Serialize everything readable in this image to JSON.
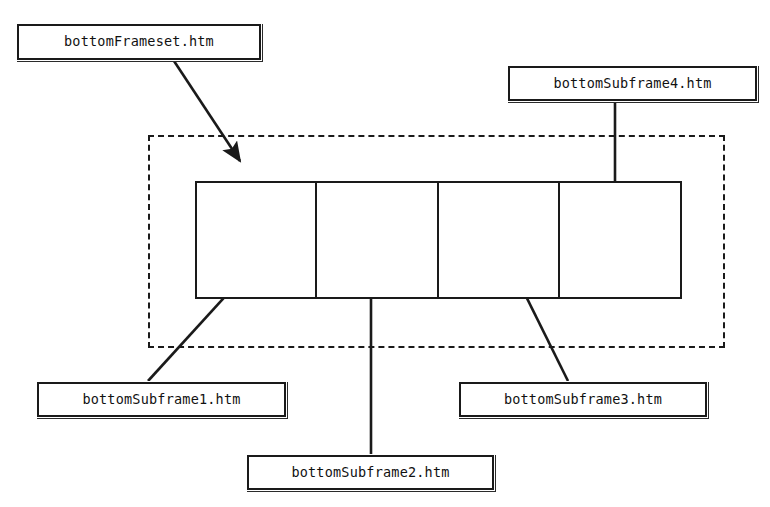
{
  "diagram": {
    "type": "html-frameset-structure-diagram",
    "background_color": "#ffffff",
    "stroke_color": "#1a1a1a",
    "labels": {
      "frameset": "bottomFrameset.htm",
      "subframe1": "bottomSubframe1.htm",
      "subframe2": "bottomSubframe2.htm",
      "subframe3": "bottomSubframe3.htm",
      "subframe4": "bottomSubframe4.htm"
    },
    "frameset_container": {
      "style": "dashed",
      "x": 148,
      "y": 135,
      "width": 577,
      "height": 213
    },
    "frame_row": {
      "x": 195,
      "y": 181,
      "width": 487,
      "height": 118,
      "cell_count": 4,
      "dividers_x": [
        315,
        437,
        558
      ]
    },
    "cells": [
      {
        "name": "frame-cell-1",
        "x": 195,
        "y": 181,
        "width": 120,
        "height": 118
      },
      {
        "name": "frame-cell-2",
        "x": 315,
        "y": 181,
        "width": 122,
        "height": 118
      },
      {
        "name": "frame-cell-3",
        "x": 437,
        "y": 181,
        "width": 121,
        "height": 118
      },
      {
        "name": "frame-cell-4",
        "x": 558,
        "y": 181,
        "width": 124,
        "height": 118
      }
    ],
    "label_boxes": [
      {
        "name": "label-box-frameset",
        "x": 17,
        "y": 24,
        "width": 244,
        "height": 36
      },
      {
        "name": "label-box-subframe4",
        "x": 508,
        "y": 66,
        "width": 249,
        "height": 35
      },
      {
        "name": "label-box-subframe1",
        "x": 37,
        "y": 382,
        "width": 249,
        "height": 35
      },
      {
        "name": "label-box-subframe3",
        "x": 459,
        "y": 382,
        "width": 248,
        "height": 35
      },
      {
        "name": "label-box-subframe2",
        "x": 247,
        "y": 455,
        "width": 247,
        "height": 35
      }
    ],
    "arrows": [
      {
        "name": "arrow-frameset-to-container",
        "from": [
          174,
          61
        ],
        "to": [
          240,
          163
        ],
        "target": "frameset-container"
      },
      {
        "name": "arrow-subframe4-to-cell4",
        "from": [
          615,
          101
        ],
        "to": [
          615,
          218
        ],
        "target": "frame-cell-4"
      },
      {
        "name": "arrow-subframe1-to-cell1",
        "from": [
          148,
          381
        ],
        "to": [
          261,
          254
        ],
        "target": "frame-cell-1"
      },
      {
        "name": "arrow-subframe2-to-cell2",
        "from": [
          371,
          454
        ],
        "to": [
          371,
          254
        ],
        "target": "frame-cell-2"
      },
      {
        "name": "arrow-subframe3-to-cell3",
        "from": [
          568,
          381
        ],
        "to": [
          505,
          254
        ],
        "target": "frame-cell-3"
      }
    ]
  }
}
